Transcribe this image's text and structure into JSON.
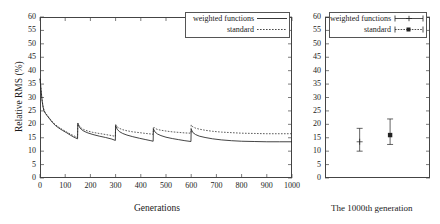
{
  "chart_data": [
    {
      "type": "line",
      "panel": "left",
      "title": "",
      "xlabel": "Generations",
      "ylabel": "Relative RMS (%)",
      "xlim": [
        0,
        1000
      ],
      "ylim": [
        0,
        60
      ],
      "xticks": [
        0,
        100,
        200,
        300,
        400,
        500,
        600,
        700,
        800,
        900,
        1000
      ],
      "yticks": [
        0,
        5,
        10,
        15,
        20,
        25,
        30,
        35,
        40,
        45,
        50,
        55,
        60
      ],
      "grid": false,
      "legend_position": "top-right",
      "restart_generations": [
        150,
        300,
        450,
        600
      ],
      "series": [
        {
          "name": "weighted functions",
          "style": "solid",
          "color": "#222222",
          "points": [
            [
              0,
              37.0
            ],
            [
              4,
              33.0
            ],
            [
              8,
              29.0
            ],
            [
              12,
              26.5
            ],
            [
              16,
              25.0
            ],
            [
              22,
              24.0
            ],
            [
              30,
              23.0
            ],
            [
              40,
              21.8
            ],
            [
              50,
              20.6
            ],
            [
              62,
              19.5
            ],
            [
              75,
              18.6
            ],
            [
              90,
              17.7
            ],
            [
              105,
              16.9
            ],
            [
              120,
              16.0
            ],
            [
              135,
              15.2
            ],
            [
              149,
              14.6
            ],
            [
              150,
              20.3
            ],
            [
              156,
              19.0
            ],
            [
              164,
              18.1
            ],
            [
              175,
              17.4
            ],
            [
              190,
              16.8
            ],
            [
              210,
              16.2
            ],
            [
              235,
              15.6
            ],
            [
              260,
              15.1
            ],
            [
              285,
              14.5
            ],
            [
              299,
              14.0
            ],
            [
              300,
              19.6
            ],
            [
              306,
              18.2
            ],
            [
              315,
              17.3
            ],
            [
              328,
              16.6
            ],
            [
              345,
              16.0
            ],
            [
              368,
              15.4
            ],
            [
              395,
              14.8
            ],
            [
              420,
              14.3
            ],
            [
              440,
              13.9
            ],
            [
              449,
              13.7
            ],
            [
              450,
              18.3
            ],
            [
              456,
              17.2
            ],
            [
              466,
              16.4
            ],
            [
              480,
              15.8
            ],
            [
              500,
              15.2
            ],
            [
              525,
              14.7
            ],
            [
              550,
              14.3
            ],
            [
              575,
              13.9
            ],
            [
              599,
              13.6
            ],
            [
              600,
              18.2
            ],
            [
              606,
              17.0
            ],
            [
              617,
              16.2
            ],
            [
              632,
              15.6
            ],
            [
              655,
              15.1
            ],
            [
              685,
              14.6
            ],
            [
              720,
              14.2
            ],
            [
              760,
              13.9
            ],
            [
              800,
              13.7
            ],
            [
              850,
              13.6
            ],
            [
              900,
              13.5
            ],
            [
              950,
              13.5
            ],
            [
              1000,
              13.5
            ]
          ]
        },
        {
          "name": "standard",
          "style": "dotted",
          "color": "#333333",
          "points": [
            [
              0,
              37.0
            ],
            [
              4,
              33.2
            ],
            [
              8,
              29.3
            ],
            [
              12,
              26.8
            ],
            [
              16,
              25.2
            ],
            [
              22,
              24.2
            ],
            [
              30,
              23.2
            ],
            [
              40,
              22.0
            ],
            [
              50,
              20.9
            ],
            [
              62,
              19.8
            ],
            [
              75,
              18.9
            ],
            [
              90,
              18.0
            ],
            [
              105,
              17.2
            ],
            [
              120,
              16.4
            ],
            [
              135,
              15.7
            ],
            [
              149,
              15.1
            ],
            [
              150,
              20.5
            ],
            [
              156,
              19.4
            ],
            [
              164,
              18.6
            ],
            [
              175,
              18.0
            ],
            [
              190,
              17.5
            ],
            [
              210,
              17.0
            ],
            [
              235,
              16.6
            ],
            [
              260,
              16.2
            ],
            [
              285,
              15.8
            ],
            [
              299,
              15.5
            ],
            [
              300,
              20.0
            ],
            [
              306,
              19.1
            ],
            [
              315,
              18.5
            ],
            [
              328,
              18.0
            ],
            [
              345,
              17.6
            ],
            [
              368,
              17.2
            ],
            [
              395,
              16.9
            ],
            [
              420,
              16.6
            ],
            [
              440,
              16.4
            ],
            [
              449,
              16.3
            ],
            [
              450,
              19.1
            ],
            [
              456,
              18.5
            ],
            [
              466,
              18.1
            ],
            [
              480,
              17.8
            ],
            [
              500,
              17.5
            ],
            [
              525,
              17.2
            ],
            [
              550,
              17.0
            ],
            [
              575,
              16.8
            ],
            [
              599,
              16.7
            ],
            [
              600,
              19.8
            ],
            [
              606,
              19.1
            ],
            [
              617,
              18.6
            ],
            [
              632,
              18.2
            ],
            [
              655,
              17.8
            ],
            [
              685,
              17.4
            ],
            [
              720,
              17.1
            ],
            [
              760,
              16.9
            ],
            [
              800,
              16.7
            ],
            [
              850,
              16.6
            ],
            [
              900,
              16.5
            ],
            [
              950,
              16.5
            ],
            [
              1000,
              16.5
            ]
          ]
        }
      ]
    },
    {
      "type": "scatter",
      "panel": "right",
      "title": "",
      "caption": "The 1000th generation",
      "xlabel": "",
      "ylabel": "",
      "ylim": [
        0,
        60
      ],
      "yticks": [
        0,
        5,
        10,
        15,
        20,
        25,
        30,
        35,
        40,
        45,
        50,
        55,
        60
      ],
      "grid": false,
      "legend_position": "top-left",
      "error_bars": true,
      "points": [
        {
          "name": "weighted functions",
          "marker": "plus",
          "color": "#222222",
          "x_frac": 0.33,
          "value": 13.5,
          "low": 10.0,
          "high": 18.5
        },
        {
          "name": "standard",
          "marker": "square",
          "color": "#222222",
          "x_frac": 0.62,
          "value": 16.0,
          "low": 12.5,
          "high": 22.0
        }
      ]
    }
  ],
  "left_panel": {
    "ylabel": "Relative RMS (%)",
    "xlabel": "Generations",
    "yticks": [
      "60",
      "55",
      "50",
      "45",
      "40",
      "35",
      "30",
      "25",
      "20",
      "15",
      "10",
      "5",
      "0"
    ],
    "xticks": [
      "0",
      "100",
      "200",
      "300",
      "400",
      "500",
      "600",
      "700",
      "800",
      "900",
      "1000"
    ],
    "legend": {
      "items": [
        {
          "label": "weighted functions",
          "key": "solid-line-key"
        },
        {
          "label": "standard",
          "key": "dotted-line-key"
        }
      ]
    }
  },
  "right_panel": {
    "caption": "The 1000th generation",
    "yticks": [
      "60",
      "55",
      "50",
      "45",
      "40",
      "35",
      "30",
      "25",
      "20",
      "15",
      "10",
      "5",
      "0"
    ],
    "legend": {
      "items": [
        {
          "label": "weighted functions",
          "key": "errorbar-plus-key"
        },
        {
          "label": "standard",
          "key": "errorbar-square-key"
        }
      ]
    }
  },
  "colors": {
    "axis": "#444444",
    "series_solid": "#222222",
    "series_dotted": "#333333",
    "background": "#ffffff"
  }
}
